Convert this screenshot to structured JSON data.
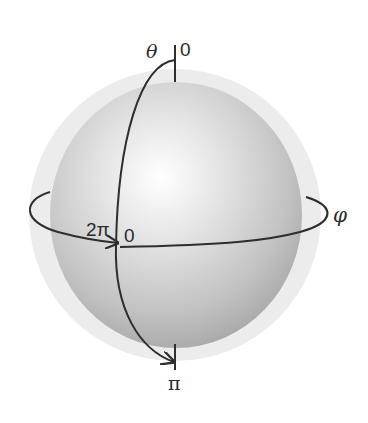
{
  "diagram": {
    "labels": {
      "theta": "θ",
      "theta_start": "0",
      "theta_end": "π",
      "phi": "φ",
      "phi_start": "0",
      "phi_end": "2π"
    },
    "colors": {
      "background": "#ffffff",
      "halo": "#ececec",
      "sphere_highlight": "#ffffff",
      "sphere_mid": "#d6d6d6",
      "sphere_edge": "#a9a9a9",
      "stroke": "#2e2e2e"
    }
  }
}
